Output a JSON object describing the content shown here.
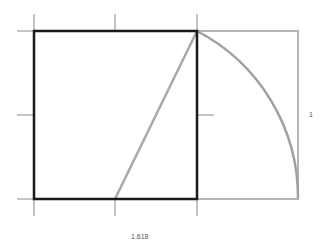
{
  "diagram": {
    "labels": {
      "width": "1.618",
      "height": "1"
    },
    "colors": {
      "square": "#1a1a1a",
      "construction": "#a8a8a8",
      "ticks": "#888888",
      "label": "#555555"
    }
  }
}
